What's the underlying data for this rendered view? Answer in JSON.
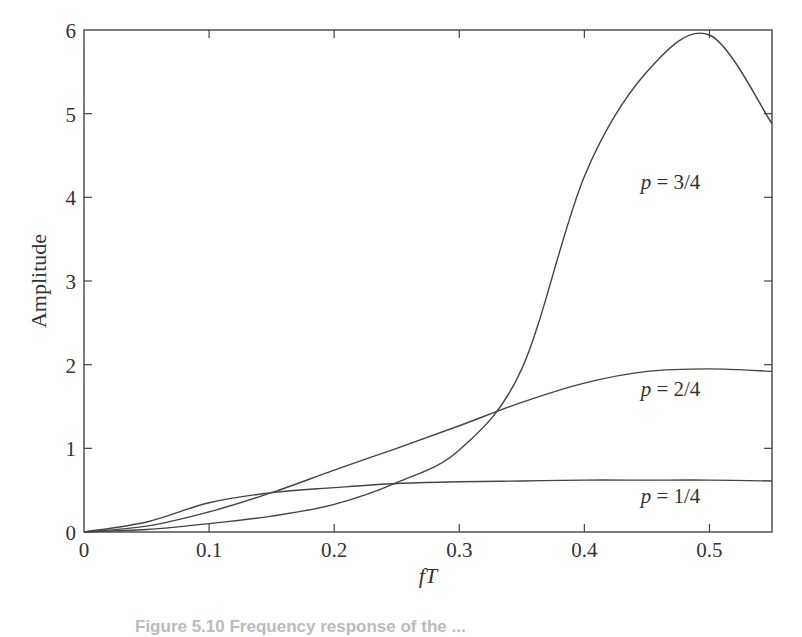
{
  "chart_data": {
    "type": "line",
    "title": "",
    "xlabel": "fT",
    "ylabel": "Amplitude",
    "xlim": [
      0,
      0.55
    ],
    "ylim": [
      0,
      6
    ],
    "grid": false,
    "legend": "inline curve labels",
    "x_ticks": [
      "0",
      "0.1",
      "0.2",
      "0.3",
      "0.4",
      "0.5"
    ],
    "y_ticks": [
      "0",
      "1",
      "2",
      "3",
      "4",
      "5",
      "6"
    ],
    "x": [
      0,
      0.05,
      0.1,
      0.15,
      0.2,
      0.25,
      0.3,
      0.35,
      0.4,
      0.45,
      0.5,
      0.55
    ],
    "series": [
      {
        "name": "p = 1/4",
        "label_pos": [
          0.445,
          0.35
        ],
        "values": [
          0,
          0.12,
          0.35,
          0.47,
          0.53,
          0.58,
          0.6,
          0.61,
          0.62,
          0.62,
          0.62,
          0.61
        ]
      },
      {
        "name": "p = 2/4",
        "label_pos": [
          0.445,
          1.62
        ],
        "values": [
          0,
          0.07,
          0.24,
          0.47,
          0.74,
          1.0,
          1.27,
          1.55,
          1.78,
          1.92,
          1.95,
          1.92
        ]
      },
      {
        "name": "p = 3/4",
        "label_pos": [
          0.445,
          4.1
        ],
        "values": [
          0,
          0.03,
          0.1,
          0.19,
          0.33,
          0.59,
          0.98,
          1.95,
          4.25,
          5.5,
          5.94,
          4.88
        ]
      }
    ],
    "annotations": [
      "p = 3/4",
      "p = 2/4",
      "p = 1/4"
    ]
  },
  "caption": "Figure 5.10  Frequency response of the ..."
}
